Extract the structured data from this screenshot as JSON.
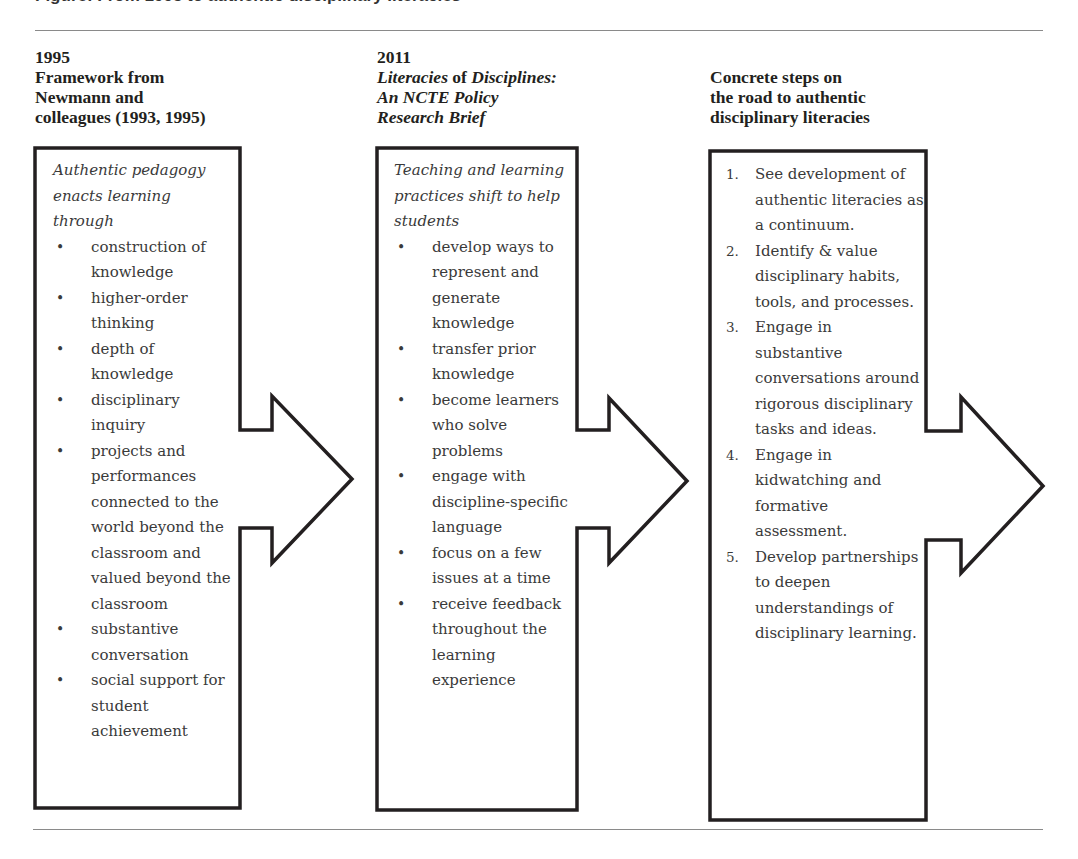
{
  "figure": {
    "caption_partial": "Figure: From 1995 to authentic disciplinary literacies"
  },
  "columns": [
    {
      "year": "1995",
      "title_lines": [
        "Framework from",
        "Newmann and",
        "colleagues (1993, 1995)"
      ],
      "intro": "Authentic pedagogy enacts learning through",
      "list_type": "bullet",
      "items": [
        "construction of knowledge",
        "higher-order thinking",
        "depth of knowledge",
        "disciplinary inquiry",
        "projects and performances connected to the world beyond the classroom and valued beyond the classroom",
        "substantive conversation",
        "social support for student achievement"
      ]
    },
    {
      "year": "2011",
      "title_parts": {
        "line1_italic_a": "Literacies ",
        "line1_upright": "of",
        "line1_italic_b": " Disciplines:",
        "line2": "An NCTE Policy",
        "line3": "Research Brief"
      },
      "intro": "Teaching and learning practices shift to help students",
      "list_type": "bullet",
      "items": [
        "develop ways to represent and generate knowledge",
        "transfer prior knowledge",
        "become learners who solve problems",
        "engage with discipline-specific language",
        "focus on a few issues at a time",
        "receive feedback throughout the learning experience"
      ]
    },
    {
      "title_lines": [
        "Concrete steps on",
        "the road to authentic",
        "disciplinary literacies"
      ],
      "list_type": "numbered",
      "items": [
        {
          "num": "1.",
          "text": "See development of authentic literacies as a continuum."
        },
        {
          "num": "2.",
          "text": "Identify & value disciplinary habits, tools, and processes."
        },
        {
          "num": "3.",
          "text": "Engage in substantive conversations around rigorous disciplinary tasks and ideas."
        },
        {
          "num": "4.",
          "text": "Engage in kidwatching and formative assessment."
        },
        {
          "num": "5.",
          "text": "Develop partnerships to deepen understandings of disciplinary learning."
        }
      ]
    }
  ],
  "bullet_glyph": "•",
  "colors": {
    "stroke": "#231f20",
    "text": "#3a3a3a",
    "rule": "#8a8a8a"
  }
}
